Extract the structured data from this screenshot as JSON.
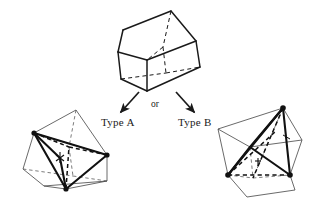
{
  "figure": {
    "width": 312,
    "height": 204,
    "background_color": "#ffffff",
    "stroke_color": "#1a1a1a",
    "thin_stroke_color": "#3a3a3a"
  },
  "labels": {
    "type_a": "Type A",
    "or": "or",
    "type_b": "Type B"
  },
  "shapes": {
    "source_prism": {
      "name": "prism-top",
      "description": "triangular prism drawn in perspective with hidden edges dashed",
      "solid_edges": [
        [
          118,
          52,
          123,
          30
        ],
        [
          123,
          30,
          171,
          11
        ],
        [
          171,
          11,
          196,
          41
        ],
        [
          196,
          41,
          200,
          67
        ],
        [
          118,
          52,
          147,
          60
        ],
        [
          147,
          60,
          196,
          41
        ],
        [
          147,
          60,
          147,
          91
        ],
        [
          118,
          52,
          121,
          78
        ],
        [
          121,
          78,
          147,
          91
        ],
        [
          147,
          91,
          200,
          67
        ],
        [
          200,
          67,
          196,
          41
        ],
        [
          123,
          30,
          118,
          52
        ]
      ],
      "dashed_edges": [
        [
          171,
          11,
          163,
          46
        ],
        [
          163,
          46,
          147,
          60
        ],
        [
          163,
          46,
          165,
          72
        ],
        [
          121,
          78,
          165,
          72
        ],
        [
          165,
          72,
          200,
          67
        ]
      ]
    },
    "type_a_solid": {
      "name": "polyhedron-type-a",
      "description": "prism with Type A tetrahedral subdivision, bold interior diagonals, marked vertices",
      "vertices": [
        [
          34,
          133
        ],
        [
          107,
          155
        ],
        [
          66,
          189
        ],
        [
          76,
          110
        ],
        [
          23,
          169
        ],
        [
          107,
          181
        ],
        [
          44,
          186
        ]
      ],
      "marked_vertices": [
        [
          34,
          133
        ],
        [
          107,
          155
        ],
        [
          66,
          189
        ]
      ]
    },
    "type_b_solid": {
      "name": "polyhedron-type-b",
      "description": "prism with Type B tetrahedral subdivision, bold interior diagonals, marked vertices",
      "vertices": [
        [
          283,
          108
        ],
        [
          228,
          175
        ],
        [
          290,
          175
        ],
        [
          250,
          147
        ],
        [
          218,
          129
        ],
        [
          247,
          197
        ],
        [
          295,
          190
        ]
      ],
      "marked_vertices": [
        [
          283,
          108
        ],
        [
          228,
          175
        ],
        [
          290,
          175
        ]
      ]
    }
  },
  "arrows": {
    "left": {
      "name": "arrow-to-type-a",
      "from": [
        139,
        92
      ],
      "to": [
        119,
        114
      ]
    },
    "right": {
      "name": "arrow-to-type-b",
      "from": [
        176,
        92
      ],
      "to": [
        196,
        114
      ]
    }
  }
}
